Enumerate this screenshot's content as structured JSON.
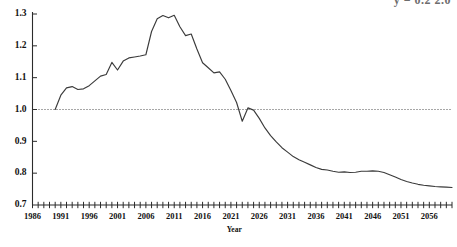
{
  "title": {
    "text": "y = 0.2 2.0",
    "note": "partially cropped header text at top-right of image"
  },
  "axis_name_x": "Year",
  "chart_data": {
    "type": "line",
    "title": "",
    "xlabel": "Year",
    "ylabel": "",
    "xlim": [
      1986,
      2060
    ],
    "ylim": [
      0.7,
      1.3
    ],
    "grid": false,
    "legend": null,
    "y_ticks": [
      "0.7",
      "0.8",
      "0.9",
      "1.0",
      "1.1",
      "1.2",
      "1.3"
    ],
    "y_tick_values": [
      0.7,
      0.8,
      0.9,
      1.0,
      1.1,
      1.2,
      1.3
    ],
    "x_ticks": [
      "1986",
      "1991",
      "1996",
      "2001",
      "2006",
      "2011",
      "2016",
      "2021",
      "2026",
      "2031",
      "2036",
      "2041",
      "2046",
      "2051",
      "2056"
    ],
    "x_tick_values": [
      1986,
      1991,
      1996,
      2001,
      2006,
      2011,
      2016,
      2021,
      2026,
      2031,
      2036,
      2041,
      2046,
      2051,
      2056
    ],
    "x_minor_tick_step": 1,
    "reference_line": {
      "y": 1.0,
      "style": "dotted",
      "label": ""
    },
    "series": [
      {
        "name": "index",
        "color": "#3b3b3b",
        "x": [
          1990,
          1991,
          1992,
          1993,
          1994,
          1995,
          1996,
          1997,
          1998,
          1999,
          2000,
          2001,
          2002,
          2003,
          2004,
          2005,
          2006,
          2007,
          2008,
          2009,
          2010,
          2011,
          2012,
          2013,
          2014,
          2015,
          2016,
          2017,
          2018,
          2019,
          2020,
          2021,
          2022,
          2023,
          2024,
          2025,
          2026,
          2027,
          2028,
          2029,
          2030,
          2031,
          2032,
          2033,
          2034,
          2035,
          2036,
          2037,
          2038,
          2039,
          2040,
          2041,
          2042,
          2043,
          2044,
          2045,
          2046,
          2047,
          2048,
          2049,
          2050,
          2051,
          2052,
          2053,
          2054,
          2055,
          2056,
          2057,
          2058,
          2059,
          2060
        ],
        "y": [
          1.0,
          1.045,
          1.068,
          1.072,
          1.063,
          1.065,
          1.075,
          1.09,
          1.105,
          1.11,
          1.148,
          1.124,
          1.152,
          1.162,
          1.165,
          1.168,
          1.172,
          1.245,
          1.285,
          1.295,
          1.288,
          1.296,
          1.26,
          1.232,
          1.237,
          1.19,
          1.147,
          1.131,
          1.115,
          1.118,
          1.095,
          1.06,
          1.022,
          0.963,
          1.005,
          0.998,
          0.972,
          0.942,
          0.918,
          0.898,
          0.88,
          0.866,
          0.852,
          0.842,
          0.834,
          0.826,
          0.818,
          0.812,
          0.81,
          0.806,
          0.803,
          0.804,
          0.802,
          0.803,
          0.806,
          0.806,
          0.807,
          0.806,
          0.802,
          0.795,
          0.788,
          0.78,
          0.774,
          0.769,
          0.765,
          0.762,
          0.76,
          0.758,
          0.757,
          0.756,
          0.755
        ]
      }
    ]
  }
}
